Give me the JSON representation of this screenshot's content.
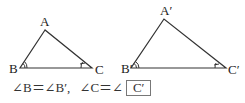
{
  "triangle1": {
    "labels": {
      "A": "A",
      "B": "B",
      "C": "C"
    },
    "vertices": {
      "A": [
        45,
        30
      ],
      "B": [
        20,
        68
      ],
      "C": [
        92,
        68
      ]
    }
  },
  "triangle2": {
    "labels": {
      "A": "A′",
      "B": "B′",
      "C": "C′"
    },
    "vertices": {
      "A": [
        164,
        19
      ],
      "B": [
        131,
        68
      ],
      "C": [
        226,
        68
      ]
    }
  },
  "statement": {
    "part1": "∠B＝∠B′,",
    "part2": "∠C＝∠",
    "answer": "C′"
  },
  "colors": {
    "line": "#333333",
    "box_border": "#777777"
  }
}
